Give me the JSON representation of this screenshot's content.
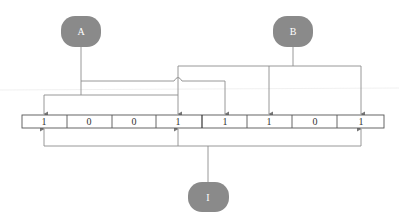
{
  "diagram": {
    "colors": {
      "node_fill": "#8a8a8a",
      "line": "#8c8c8c",
      "cell_border": "#555555",
      "text": "#333333",
      "faint_rule": "#e6e6e6"
    },
    "nodes": [
      {
        "id": "A",
        "label": "A",
        "cx": 81,
        "cy": 32
      },
      {
        "id": "B",
        "label": "B",
        "cx": 293,
        "cy": 32
      },
      {
        "id": "I",
        "label": "I",
        "cx": 208,
        "cy": 197
      }
    ],
    "register": {
      "x": 22,
      "y": 115,
      "cell_width": 45.25,
      "height": 13,
      "bits": [
        "1",
        "0",
        "0",
        "1",
        "1",
        "1",
        "0",
        "1"
      ]
    },
    "connections": [
      {
        "from": "A",
        "to_bits": [
          1,
          4,
          5
        ]
      },
      {
        "from": "B",
        "to_bits": [
          4,
          6,
          8
        ]
      },
      {
        "from": "I",
        "to_bits": [
          1,
          4,
          8
        ]
      }
    ]
  }
}
